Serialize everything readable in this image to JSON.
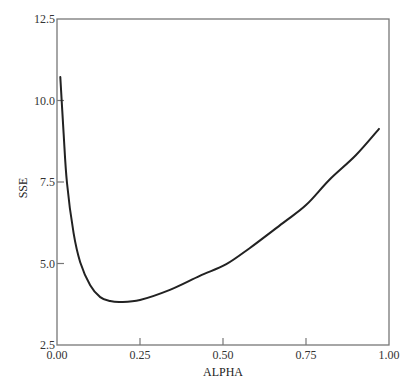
{
  "chart_data": {
    "type": "line",
    "title": "",
    "xlabel": "ALPHA",
    "ylabel": "SSE",
    "xlim": [
      0.0,
      1.0
    ],
    "ylim": [
      2.5,
      12.5
    ],
    "grid": false,
    "legend": null,
    "x_ticks": [
      "0.00",
      "0.25",
      "0.50",
      "0.75",
      "1.00"
    ],
    "y_ticks": [
      "2.5",
      "5.0",
      "7.5",
      "10.0",
      "12.5"
    ],
    "series": [
      {
        "name": "SSE",
        "color": "#222222",
        "x": [
          0.01,
          0.02,
          0.03,
          0.05,
          0.07,
          0.1,
          0.13,
          0.16,
          0.19,
          0.25,
          0.34,
          0.43,
          0.51,
          0.58,
          0.68,
          0.75,
          0.82,
          0.9,
          0.97
        ],
        "y": [
          10.72,
          9.0,
          7.47,
          5.93,
          5.04,
          4.33,
          3.97,
          3.85,
          3.82,
          3.88,
          4.19,
          4.62,
          4.98,
          5.47,
          6.24,
          6.79,
          7.56,
          8.32,
          9.13
        ]
      }
    ]
  },
  "axes": {
    "x_label": "ALPHA",
    "y_label": "SSE"
  }
}
